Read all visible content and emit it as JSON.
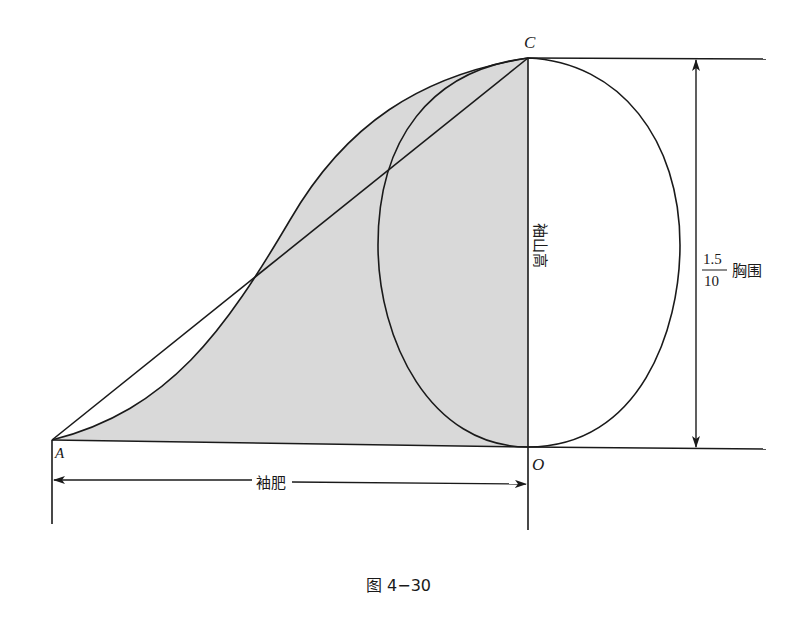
{
  "diagram": {
    "points": {
      "A": "A",
      "C": "C",
      "O": "O"
    },
    "labels": {
      "sleeve_cap_height": "袖山高",
      "sleeve_width": "袖肥",
      "chest_fraction_numerator": "1.5",
      "chest_fraction_denominator": "10",
      "chest_label": "胸围"
    },
    "caption": "图 4−30",
    "colors": {
      "line": "#1a1a1a",
      "shaded_fill": "#d9d9d9",
      "background": "#ffffff"
    }
  }
}
